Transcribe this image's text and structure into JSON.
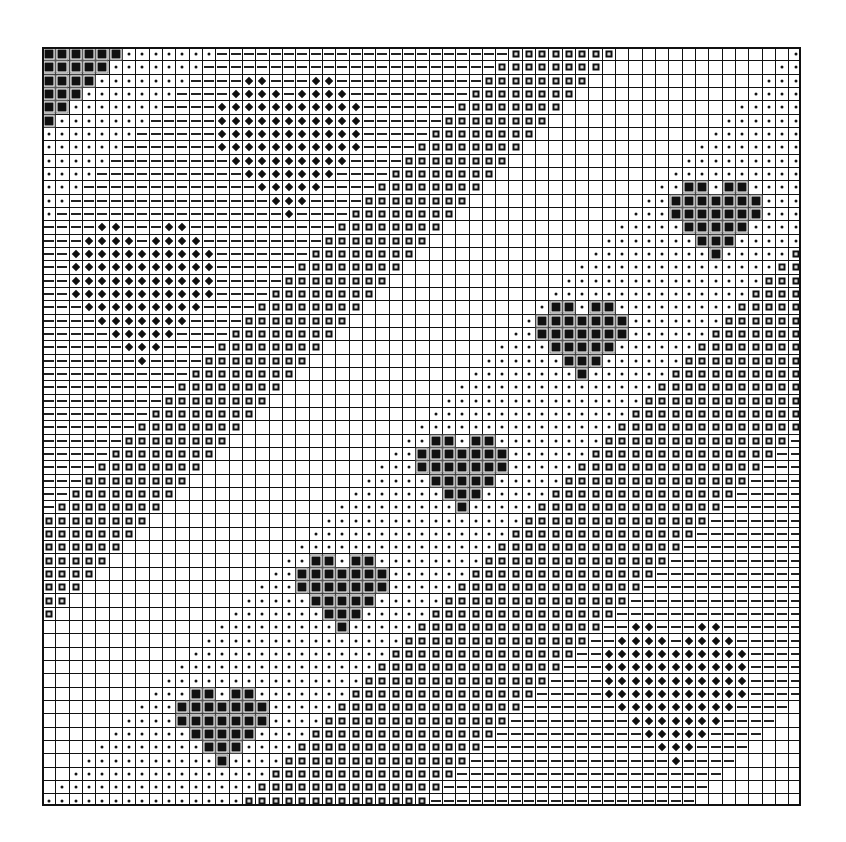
{
  "grid": {
    "cols": 57,
    "rows": 57,
    "cell_px": 13.33,
    "glyph_legend": {
      "empty": "blank cell",
      "dot": "small dot",
      "dash": "horizontal dash",
      "sq": "hollow square",
      "fill": "filled square",
      "dia": "diamond"
    },
    "diagonal_bands": [
      {
        "min_sum": 0,
        "max_sum": 12,
        "glyph": "dot"
      },
      {
        "min_sum": 13,
        "max_sum": 34,
        "glyph": "dash"
      },
      {
        "min_sum": 35,
        "max_sum": 42,
        "glyph": "sq"
      },
      {
        "min_sum": 43,
        "max_sum": 55,
        "glyph": "empty"
      },
      {
        "min_sum": 56,
        "max_sum": 70,
        "glyph": "dot"
      },
      {
        "min_sum": 71,
        "max_sum": 84,
        "glyph": "sq"
      },
      {
        "min_sum": 85,
        "max_sum": 104,
        "glyph": "dash"
      },
      {
        "min_sum": 105,
        "max_sum": 200,
        "glyph": "empty"
      }
    ],
    "shapes": {
      "diamond_heart": {
        "glyph": "dia",
        "rows": [
          [
            2,
            3,
            7,
            8
          ],
          [
            1,
            2,
            3,
            4,
            6,
            7,
            8,
            9
          ],
          [
            0,
            1,
            2,
            3,
            4,
            5,
            6,
            7,
            8,
            9,
            10
          ],
          [
            0,
            1,
            2,
            3,
            4,
            5,
            6,
            7,
            8,
            9,
            10
          ],
          [
            0,
            1,
            2,
            3,
            4,
            5,
            6,
            7,
            8,
            9,
            10
          ],
          [
            0,
            1,
            2,
            3,
            4,
            5,
            6,
            7,
            8,
            9,
            10
          ],
          [
            1,
            2,
            3,
            4,
            5,
            6,
            7,
            8,
            9
          ],
          [
            2,
            3,
            4,
            5,
            6,
            7,
            8
          ],
          [
            3,
            4,
            5,
            6,
            7
          ],
          [
            4,
            5,
            6
          ],
          [
            5
          ]
        ]
      },
      "black_heart": {
        "glyph": "fill",
        "rows": [
          [
            1,
            2,
            4,
            5
          ],
          [
            0,
            1,
            2,
            3,
            4,
            5,
            6
          ],
          [
            0,
            1,
            2,
            3,
            4,
            5,
            6
          ],
          [
            1,
            2,
            3,
            4,
            5
          ],
          [
            2,
            3,
            4
          ],
          [
            3
          ]
        ]
      },
      "corner_black": {
        "glyph": "fill",
        "rows": [
          [
            0,
            1,
            2,
            3,
            4,
            5
          ],
          [
            0,
            1,
            2,
            3,
            4
          ],
          [
            0,
            1,
            2,
            3
          ],
          [
            0,
            1,
            2
          ],
          [
            0,
            1
          ],
          [
            0
          ]
        ]
      }
    },
    "placements": [
      {
        "shape": "corner_black",
        "row": 0,
        "col": 0
      },
      {
        "shape": "diamond_heart",
        "row": 2,
        "col": 13
      },
      {
        "shape": "diamond_heart",
        "row": 13,
        "col": 2
      },
      {
        "shape": "diamond_heart",
        "row": 43,
        "col": 42
      },
      {
        "shape": "black_heart",
        "row": 10,
        "col": 47
      },
      {
        "shape": "black_heart",
        "row": 19,
        "col": 37
      },
      {
        "shape": "black_heart",
        "row": 29,
        "col": 28
      },
      {
        "shape": "black_heart",
        "row": 38,
        "col": 19
      },
      {
        "shape": "black_heart",
        "row": 48,
        "col": 10
      }
    ]
  }
}
